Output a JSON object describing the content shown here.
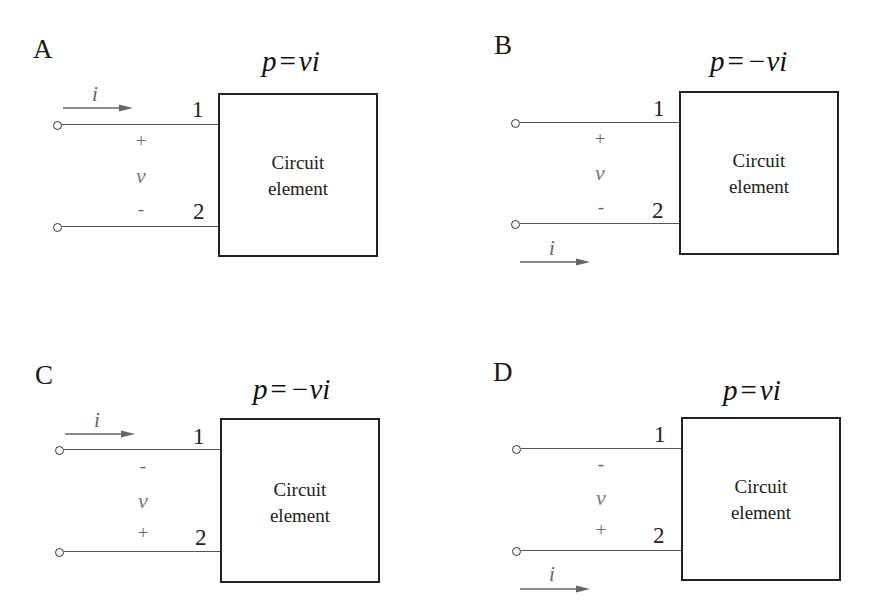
{
  "figure": {
    "panels": [
      {
        "id": "A",
        "label": "A",
        "formula": {
          "lhs": "p",
          "eq": "=",
          "rhs": "vi"
        },
        "box_text": [
          "Circuit",
          "element"
        ],
        "terminals": [
          "1",
          "2"
        ],
        "voltage": {
          "symbol": "v",
          "top_sign": "+",
          "bottom_sign": "-"
        },
        "current": {
          "symbol": "i",
          "position": "top",
          "direction": "right"
        }
      },
      {
        "id": "B",
        "label": "B",
        "formula": {
          "lhs": "p",
          "eq": "=",
          "rhs": "−vi"
        },
        "box_text": [
          "Circuit",
          "element"
        ],
        "terminals": [
          "1",
          "2"
        ],
        "voltage": {
          "symbol": "v",
          "top_sign": "+",
          "bottom_sign": "-"
        },
        "current": {
          "symbol": "i",
          "position": "bottom",
          "direction": "right"
        }
      },
      {
        "id": "C",
        "label": "C",
        "formula": {
          "lhs": "p",
          "eq": "=",
          "rhs": "−vi"
        },
        "box_text": [
          "Circuit",
          "element"
        ],
        "terminals": [
          "1",
          "2"
        ],
        "voltage": {
          "symbol": "v",
          "top_sign": "-",
          "bottom_sign": "+"
        },
        "current": {
          "symbol": "i",
          "position": "top",
          "direction": "right"
        }
      },
      {
        "id": "D",
        "label": "D",
        "formula": {
          "lhs": "p",
          "eq": "=",
          "rhs": "vi"
        },
        "box_text": [
          "Circuit",
          "element"
        ],
        "terminals": [
          "1",
          "2"
        ],
        "voltage": {
          "symbol": "v",
          "top_sign": "-",
          "bottom_sign": "+"
        },
        "current": {
          "symbol": "i",
          "position": "bottom",
          "direction": "right"
        }
      }
    ],
    "colors": {
      "line": "#555555",
      "box_border": "#222222",
      "polarity_text": "#666666",
      "background": "#ffffff"
    }
  }
}
